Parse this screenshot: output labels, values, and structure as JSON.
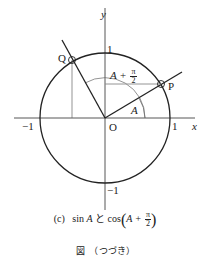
{
  "figure": {
    "axis_labels": {
      "x": "x",
      "y": "y"
    },
    "tick_labels": {
      "x_pos": "1",
      "x_neg": "−1",
      "y_pos": "1",
      "y_neg": "−1"
    },
    "origin_label": "O",
    "points": [
      {
        "name": "P",
        "angle": "A"
      },
      {
        "name": "Q",
        "angle": "A + π/2"
      }
    ],
    "angle_labels": {
      "small": "A",
      "large_prefix": "A +",
      "large_frac_num": "π",
      "large_frac_den": "2"
    },
    "colors": {
      "stroke": "#222222",
      "guide": "#888888"
    }
  },
  "caption": {
    "tag": "(c)",
    "sin_text": "sin",
    "var": "A",
    "conj": "と",
    "cos_text": "cos",
    "inner_prefix": "A +",
    "frac_num": "π",
    "frac_den": "2",
    "subtitle": "図　（つづき）"
  }
}
